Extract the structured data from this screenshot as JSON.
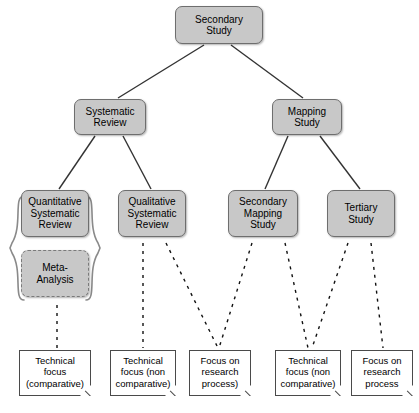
{
  "diagram": {
    "colors": {
      "node_fill": "#c8c8c8",
      "node_border": "#6e6e6e",
      "doc_fill": "#ffffff",
      "doc_border": "#4a4a4a",
      "edge": "#333333",
      "background": "#ffffff"
    },
    "nodes": [
      {
        "id": "secondary-study",
        "label": "Secondary\nStudy",
        "x": 175,
        "y": 6,
        "w": 88,
        "h": 38,
        "style": "solid"
      },
      {
        "id": "systematic-review",
        "label": "Systematic\nReview",
        "x": 74,
        "y": 99,
        "w": 72,
        "h": 36,
        "style": "solid"
      },
      {
        "id": "mapping-study",
        "label": "Mapping\nStudy",
        "x": 272,
        "y": 99,
        "w": 70,
        "h": 36,
        "style": "solid"
      },
      {
        "id": "quantitative-systematic-review",
        "label": "Quantitative\nSystematic\nReview",
        "x": 21,
        "y": 190,
        "w": 68,
        "h": 47,
        "style": "solid"
      },
      {
        "id": "qualitative-systematic-review",
        "label": "Qualitative\nSystematic\nReview",
        "x": 118,
        "y": 190,
        "w": 68,
        "h": 47,
        "style": "solid"
      },
      {
        "id": "secondary-mapping-study",
        "label": "Secondary\nMapping\nStudy",
        "x": 228,
        "y": 190,
        "w": 70,
        "h": 47,
        "style": "solid"
      },
      {
        "id": "tertiary-study",
        "label": "Tertiary\nStudy",
        "x": 327,
        "y": 190,
        "w": 68,
        "h": 47,
        "style": "solid"
      },
      {
        "id": "meta-analysis",
        "label": "Meta-\nAnalysis",
        "x": 21,
        "y": 250,
        "w": 68,
        "h": 47,
        "style": "dashed"
      }
    ],
    "annotations": [
      {
        "id": "technical-focus-comparative",
        "label": "Technical\nfocus\n(comparative)",
        "x": 19,
        "y": 350,
        "w": 72,
        "h": 46
      },
      {
        "id": "technical-focus-non-comparative-1",
        "label": "Technical\nfocus (non\ncomparative)",
        "x": 110,
        "y": 350,
        "w": 66,
        "h": 46
      },
      {
        "id": "focus-on-research-process-1",
        "label": "Focus on\nresearch\nprocess)",
        "x": 189,
        "y": 350,
        "w": 62,
        "h": 46
      },
      {
        "id": "technical-focus-non-comparative-2",
        "label": "Technical\nfocus (non\ncomparative)",
        "x": 275,
        "y": 350,
        "w": 66,
        "h": 46
      },
      {
        "id": "focus-on-research-process-2",
        "label": "Focus on\nresearch\nprocess",
        "x": 351,
        "y": 350,
        "w": 62,
        "h": 46
      }
    ],
    "edges": [
      {
        "id": "edge-secondary-to-systematic",
        "from": "secondary-study",
        "to": "systematic-review",
        "x1": 204,
        "y1": 45,
        "x2": 118,
        "y2": 98,
        "style": "solid"
      },
      {
        "id": "edge-secondary-to-mapping",
        "from": "secondary-study",
        "to": "mapping-study",
        "x1": 231,
        "y1": 45,
        "x2": 303,
        "y2": 98,
        "style": "solid"
      },
      {
        "id": "edge-systematic-to-quant",
        "from": "systematic-review",
        "to": "quantitative-systematic-review",
        "x1": 95,
        "y1": 136,
        "x2": 59,
        "y2": 189,
        "style": "solid"
      },
      {
        "id": "edge-systematic-to-qual",
        "from": "systematic-review",
        "to": "qualitative-systematic-review",
        "x1": 123,
        "y1": 136,
        "x2": 151,
        "y2": 189,
        "style": "solid"
      },
      {
        "id": "edge-mapping-to-secondary-mapping",
        "from": "mapping-study",
        "to": "secondary-mapping-study",
        "x1": 288,
        "y1": 136,
        "x2": 265,
        "y2": 189,
        "style": "solid"
      },
      {
        "id": "edge-mapping-to-tertiary",
        "from": "mapping-study",
        "to": "tertiary-study",
        "x1": 320,
        "y1": 136,
        "x2": 360,
        "y2": 189,
        "style": "solid"
      }
    ],
    "dashed_links": [
      {
        "id": "link-meta-to-technical-comparative",
        "from": "meta-analysis",
        "to": "technical-focus-comparative",
        "x1": 57,
        "y1": 305,
        "x2": 57,
        "y2": 348
      },
      {
        "id": "link-qual-to-technical-non-comparative",
        "from": "qualitative-systematic-review",
        "to": "technical-focus-non-comparative-1",
        "x1": 143,
        "y1": 243,
        "x2": 143,
        "y2": 348
      },
      {
        "id": "link-qual-to-focus-research-process",
        "from": "qualitative-systematic-review",
        "to": "focus-on-research-process-1",
        "x1": 166,
        "y1": 243,
        "x2": 218,
        "y2": 348
      },
      {
        "id": "link-secondary-mapping-to-focus-process",
        "from": "secondary-mapping-study",
        "to": "focus-on-research-process-1",
        "x1": 252,
        "y1": 243,
        "x2": 219,
        "y2": 348
      },
      {
        "id": "link-secondary-mapping-to-technical",
        "from": "secondary-mapping-study",
        "to": "technical-focus-non-comparative-2",
        "x1": 285,
        "y1": 243,
        "x2": 308,
        "y2": 348
      },
      {
        "id": "link-tertiary-to-technical-non-comparative",
        "from": "tertiary-study",
        "to": "technical-focus-non-comparative-2",
        "x1": 348,
        "y1": 243,
        "x2": 312,
        "y2": 348
      },
      {
        "id": "link-tertiary-to-focus-research-process",
        "from": "tertiary-study",
        "to": "focus-on-research-process-2",
        "x1": 371,
        "y1": 243,
        "x2": 383,
        "y2": 348
      }
    ],
    "braces": [
      {
        "id": "brace-left-quantitative-group",
        "side": "left",
        "x": 10,
        "y": 196,
        "w": 14,
        "h": 104
      },
      {
        "id": "brace-right-quantitative-group",
        "side": "right",
        "x": 86,
        "y": 196,
        "w": 14,
        "h": 104
      }
    ]
  }
}
